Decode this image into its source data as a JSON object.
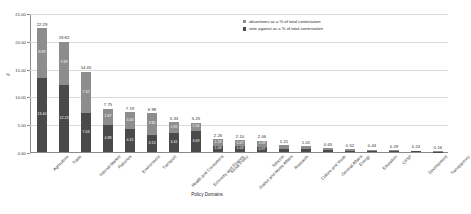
{
  "chart_data": {
    "type": "bar",
    "subtype": "stacked-bar",
    "title": "",
    "xlabel": "Policy Domains",
    "ylabel": "%",
    "ylim": [
      0,
      25
    ],
    "ytick_labels": [
      "0.00",
      "5.00",
      "10.00",
      "15.00",
      "20.00",
      "25.00"
    ],
    "ytick_values": [
      0,
      5,
      10,
      15,
      20,
      25
    ],
    "grid": true,
    "legend_position": "top-right",
    "categories": [
      "Agriculture",
      "Trade",
      "Internal Market",
      "Fisheries",
      "Environment",
      "Transport",
      "Health and Consumers",
      "Economy and Finance",
      "Social Policy",
      "Justice and Home Affairs",
      "Telecom",
      "Research",
      "Culture and Youth",
      "General Affairs",
      "Energy",
      "Education",
      "CFSP",
      "Development",
      "Transparency"
    ],
    "series": [
      {
        "name": "vote against as a % of total contestation",
        "color": "#4a4a4a",
        "values": [
          13.4,
          12.13,
          7.03,
          4.88,
          4.15,
          3.13,
          3.41,
          3.69,
          1.08,
          1.03,
          0.97,
          0.62,
          0.52,
          0.33,
          0.27,
          0.22,
          0.15,
          0.12,
          0.08
        ]
      },
      {
        "name": "absentions as a % of total contestation",
        "color": "#8d8d8d",
        "values": [
          8.89,
          7.69,
          7.42,
          2.87,
          3.04,
          3.85,
          1.92,
          1.56,
          1.18,
          1.07,
          1.09,
          0.59,
          0.49,
          0.32,
          0.25,
          0.22,
          0.14,
          0.12,
          0.08
        ]
      }
    ],
    "totals": [
      22.29,
      19.82,
      14.45,
      7.75,
      7.19,
      6.98,
      5.33,
      5.25,
      2.26,
      2.1,
      2.06,
      1.21,
      1.01,
      0.65,
      0.52,
      0.44,
      0.29,
      0.24,
      0.16
    ],
    "total_labels": [
      "22.29",
      "19.82",
      "14.45",
      "7.75",
      "7.19",
      "6.98",
      "5.33",
      "5.25",
      "2.26",
      "2.10",
      "2.06",
      "1.21",
      "1.01",
      "0.65",
      "0.52",
      "0.44",
      "0.29",
      "0.24",
      "0.16"
    ],
    "abstention_labels": [
      "8.89",
      "7.69",
      "7.42",
      "2.87",
      "3.04",
      "3.85",
      "1.92",
      "1.56",
      "1.18",
      "1.07",
      "1.09",
      "",
      "",
      "",
      "",
      "",
      "",
      "",
      ""
    ],
    "vote_against_labels": [
      "13.40",
      "12.13",
      "7.03",
      "4.88",
      "4.15",
      "3.13",
      "3.41",
      "3.69",
      "1.08",
      "1.03",
      "0.97",
      "",
      "",
      "",
      "",
      "",
      "",
      "",
      ""
    ]
  },
  "legend": {
    "items": [
      {
        "label": "absentions as a % of total contestation",
        "color": "#8d8d8d"
      },
      {
        "label": "vote against as a % of total contestation",
        "color": "#4a4a4a"
      }
    ]
  }
}
